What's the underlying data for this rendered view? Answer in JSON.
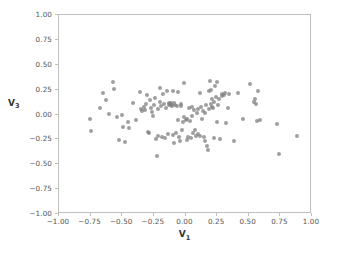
{
  "chart_data": {
    "type": "scatter",
    "title": "",
    "xlabel": "V₁",
    "ylabel": "V₃",
    "xlabel_base": "V",
    "xlabel_sub": "1",
    "ylabel_base": "V",
    "ylabel_sub": "3",
    "xlim": [
      -1.0,
      1.0
    ],
    "ylim": [
      -1.0,
      1.0
    ],
    "xticks": [
      -1.0,
      -0.75,
      -0.5,
      -0.25,
      0.0,
      0.25,
      0.5,
      0.75,
      1.0
    ],
    "yticks": [
      -1.0,
      -0.75,
      -0.5,
      -0.25,
      0.0,
      0.25,
      0.5,
      0.75,
      1.0
    ],
    "xticklabels": [
      "−1.00",
      "−0.75",
      "−0.50",
      "−0.25",
      "0.00",
      "0.25",
      "0.50",
      "0.75",
      "1.00"
    ],
    "yticklabels": [
      "−1.00",
      "−0.75",
      "−0.50",
      "−0.25",
      "0.00",
      "0.25",
      "0.50",
      "0.75",
      "1.00"
    ],
    "grid": false,
    "legend": null,
    "marker_color": "#7f7f7f",
    "marker_size": 4,
    "marker_opacity": 0.75,
    "n_points": 131,
    "points": [
      [
        -0.755,
        -0.045
      ],
      [
        -0.748,
        -0.163
      ],
      [
        -0.672,
        0.063
      ],
      [
        -0.652,
        0.215
      ],
      [
        -0.632,
        0.148
      ],
      [
        -0.606,
        0.002
      ],
      [
        -0.575,
        0.322
      ],
      [
        -0.563,
        0.252
      ],
      [
        -0.541,
        -0.022
      ],
      [
        -0.527,
        -0.258
      ],
      [
        -0.505,
        -0.006
      ],
      [
        -0.493,
        -0.122
      ],
      [
        -0.478,
        -0.278
      ],
      [
        -0.452,
        -0.075
      ],
      [
        -0.447,
        -0.137
      ],
      [
        -0.419,
        0.112
      ],
      [
        -0.392,
        -0.055
      ],
      [
        -0.362,
        0.228
      ],
      [
        -0.348,
        0.055
      ],
      [
        -0.341,
        0.038
      ],
      [
        -0.33,
        0.072
      ],
      [
        -0.322,
        0.041
      ],
      [
        -0.315,
        0.108
      ],
      [
        -0.302,
        0.198
      ],
      [
        -0.296,
        -0.172
      ],
      [
        -0.289,
        -0.182
      ],
      [
        -0.283,
        0.142
      ],
      [
        -0.275,
        0.065
      ],
      [
        -0.268,
        0.021
      ],
      [
        -0.258,
        -0.012
      ],
      [
        -0.248,
        0.095
      ],
      [
        -0.24,
        0.162
      ],
      [
        -0.233,
        -0.245
      ],
      [
        -0.228,
        -0.418
      ],
      [
        -0.221,
        -0.215
      ],
      [
        -0.215,
        0.058
      ],
      [
        -0.205,
        0.268
      ],
      [
        -0.198,
        0.122
      ],
      [
        -0.192,
        0.085
      ],
      [
        -0.185,
        -0.228
      ],
      [
        -0.178,
        0.205
      ],
      [
        -0.168,
        0.108
      ],
      [
        -0.16,
        -0.238
      ],
      [
        -0.152,
        0.062
      ],
      [
        -0.145,
        0.235
      ],
      [
        -0.138,
        -0.198
      ],
      [
        -0.132,
        0.092
      ],
      [
        -0.128,
        0.112
      ],
      [
        -0.122,
        0.105
      ],
      [
        -0.118,
        0.118
      ],
      [
        -0.112,
        0.098
      ],
      [
        -0.108,
        0.088
      ],
      [
        -0.102,
        0.232
      ],
      [
        -0.098,
        -0.208
      ],
      [
        -0.092,
        -0.282
      ],
      [
        -0.088,
        0.118
      ],
      [
        -0.082,
        0.095
      ],
      [
        -0.075,
        -0.185
      ],
      [
        -0.068,
        0.085
      ],
      [
        -0.062,
        -0.052
      ],
      [
        -0.058,
        0.225
      ],
      [
        -0.052,
        -0.225
      ],
      [
        -0.045,
        -0.265
      ],
      [
        -0.038,
        0.108
      ],
      [
        -0.032,
        0.082
      ],
      [
        -0.025,
        -0.152
      ],
      [
        -0.018,
        -0.072
      ],
      [
        -0.012,
        0.318
      ],
      [
        -0.008,
        -0.028
      ],
      [
        0.002,
        -0.055
      ],
      [
        0.008,
        -0.252
      ],
      [
        0.015,
        -0.042
      ],
      [
        0.022,
        -0.225
      ],
      [
        0.028,
        0.062
      ],
      [
        0.035,
        -0.068
      ],
      [
        0.042,
        -0.232
      ],
      [
        0.048,
        -0.012
      ],
      [
        0.055,
        0.078
      ],
      [
        0.062,
        -0.185
      ],
      [
        0.068,
        0.042
      ],
      [
        0.075,
        -0.158
      ],
      [
        0.082,
        -0.218
      ],
      [
        0.088,
        0.015
      ],
      [
        0.095,
        -0.192
      ],
      [
        0.102,
        0.055
      ],
      [
        0.112,
        -0.212
      ],
      [
        0.118,
        0.218
      ],
      [
        0.125,
        0.078
      ],
      [
        0.132,
        -0.048
      ],
      [
        0.138,
        0.032
      ],
      [
        0.145,
        -0.225
      ],
      [
        0.152,
        -0.268
      ],
      [
        0.158,
        0.012
      ],
      [
        0.165,
        0.092
      ],
      [
        0.172,
        -0.318
      ],
      [
        0.178,
        -0.352
      ],
      [
        0.182,
        0.238
      ],
      [
        0.188,
        0.055
      ],
      [
        0.192,
        0.332
      ],
      [
        0.198,
        0.242
      ],
      [
        0.202,
        0.105
      ],
      [
        0.208,
        0.075
      ],
      [
        0.212,
        0.152
      ],
      [
        0.218,
        0.068
      ],
      [
        0.222,
        -0.235
      ],
      [
        0.228,
        0.122
      ],
      [
        0.235,
        0.285
      ],
      [
        0.242,
        0.175
      ],
      [
        0.248,
        -0.072
      ],
      [
        0.252,
        0.322
      ],
      [
        0.258,
        0.092
      ],
      [
        0.265,
        0.158
      ],
      [
        0.272,
        -0.245
      ],
      [
        0.285,
        0.205
      ],
      [
        0.292,
        0.185
      ],
      [
        0.302,
        0.195
      ],
      [
        0.315,
        0.212
      ],
      [
        0.322,
        -0.082
      ],
      [
        0.335,
        0.062
      ],
      [
        0.345,
        0.205
      ],
      [
        0.382,
        -0.268
      ],
      [
        0.412,
        0.212
      ],
      [
        0.452,
        -0.048
      ],
      [
        0.512,
        0.302
      ],
      [
        0.542,
        0.128
      ],
      [
        0.548,
        0.152
      ],
      [
        0.555,
        0.108
      ],
      [
        0.562,
        -0.065
      ],
      [
        0.575,
        0.238
      ],
      [
        0.585,
        -0.052
      ],
      [
        0.722,
        -0.098
      ],
      [
        0.742,
        -0.398
      ],
      [
        0.878,
        -0.212
      ]
    ]
  }
}
